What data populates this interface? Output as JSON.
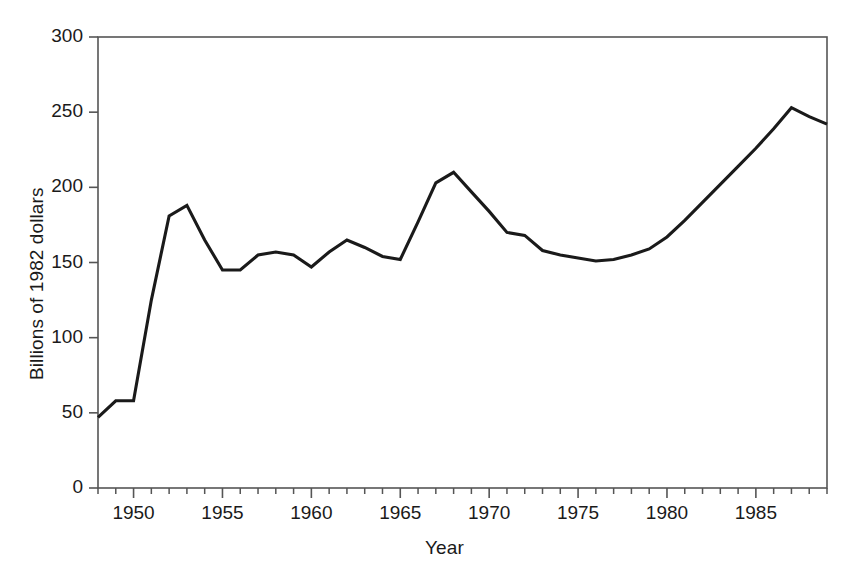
{
  "chart_data": {
    "type": "line",
    "title": "",
    "subtitle": "",
    "xlabel": "Year",
    "ylabel": "Billions of 1982 dollars",
    "xlim": [
      1948,
      1989
    ],
    "ylim": [
      0,
      300
    ],
    "grid": false,
    "legend": null,
    "x_ticks_major": [
      1950,
      1955,
      1960,
      1965,
      1970,
      1975,
      1980,
      1985
    ],
    "x_tick_labels": [
      "1950",
      "1955",
      "1960",
      "1965",
      "1970",
      "1975",
      "1980",
      "1985"
    ],
    "x_minor_tick_interval": 1,
    "y_ticks": [
      0,
      50,
      100,
      150,
      200,
      250,
      300
    ],
    "y_tick_labels": [
      "0",
      "50",
      "100",
      "150",
      "200",
      "250",
      "300"
    ],
    "series": [
      {
        "name": "Billions of 1982 dollars",
        "color": "#1a1a1a",
        "x": [
          1948,
          1949,
          1950,
          1951,
          1952,
          1953,
          1954,
          1955,
          1956,
          1957,
          1958,
          1959,
          1960,
          1961,
          1962,
          1963,
          1964,
          1965,
          1966,
          1967,
          1968,
          1969,
          1970,
          1971,
          1972,
          1973,
          1974,
          1975,
          1976,
          1977,
          1978,
          1979,
          1980,
          1981,
          1982,
          1983,
          1984,
          1985,
          1986,
          1987,
          1988,
          1989
        ],
        "values": [
          47,
          58,
          58,
          125,
          181,
          188,
          165,
          145,
          145,
          155,
          157,
          155,
          147,
          157,
          165,
          160,
          154,
          152,
          177,
          203,
          210,
          197,
          184,
          170,
          168,
          158,
          155,
          153,
          151,
          152,
          155,
          159,
          167,
          178,
          190,
          202,
          214,
          226,
          239,
          253,
          247,
          242
        ]
      }
    ]
  },
  "axes": {
    "y_title": "Billions of 1982 dollars",
    "x_title": "Year"
  }
}
